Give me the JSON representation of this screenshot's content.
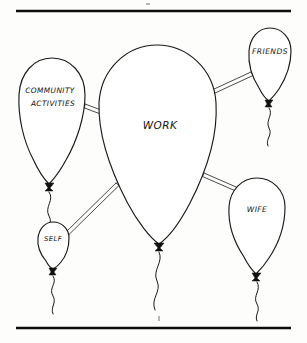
{
  "figure": {
    "background_color": "#fdfdfb",
    "ink_color": "#111111",
    "top_rule_label": "top-horizontal-rule",
    "bottom_rule_label": "bottom-horizontal-rule"
  },
  "balloons": [
    {
      "id": "work",
      "label": "WORK",
      "size": "large",
      "role": "center"
    },
    {
      "id": "community",
      "label_line1": "COMMUNITY",
      "label_line2": "ACTIVITIES",
      "size": "medium",
      "role": "satellite"
    },
    {
      "id": "friends",
      "label": "FRIENDS",
      "size": "small",
      "role": "satellite"
    },
    {
      "id": "wife",
      "label": "WIFE",
      "size": "small",
      "role": "satellite"
    },
    {
      "id": "self",
      "label": "SELF",
      "size": "tiny",
      "role": "satellite"
    }
  ],
  "connectors": [
    {
      "from": "work",
      "to": "community"
    },
    {
      "from": "work",
      "to": "friends"
    },
    {
      "from": "work",
      "to": "wife"
    },
    {
      "from": "work",
      "to": "self"
    }
  ]
}
